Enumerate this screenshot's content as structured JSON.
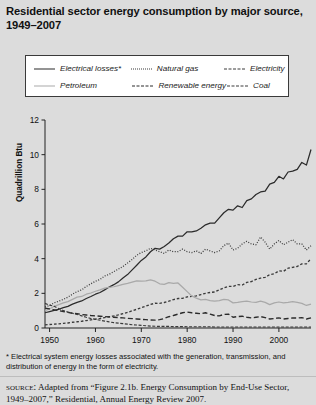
{
  "title": "Residential sector energy consumption by major source, 1949–2007",
  "legend": {
    "rows": [
      [
        {
          "label": "Electrical losses*",
          "style": "solid-dark",
          "color": "#2b2b2b"
        },
        {
          "label": "Natural gas",
          "style": "dot",
          "color": "#3a3a3a"
        },
        {
          "label": "Electricity",
          "style": "dash",
          "color": "#3a3a3a"
        }
      ],
      [
        {
          "label": "Petroleum",
          "style": "solid-light",
          "color": "#a9a9a9"
        },
        {
          "label": "Renewable energy",
          "style": "longdash",
          "color": "#2b2b2b"
        },
        {
          "label": "Coal",
          "style": "coal",
          "color": "#3a3a3a"
        }
      ]
    ]
  },
  "footnote": "* Electrical system energy losses associated with the generation, transmission, and distribution of energy in the form of electricity.",
  "source": {
    "label": "source:",
    "text": "Adapted from “Figure 2.1b. Energy Consumption by End-Use Sector, 1949–2007,” Residential, Annual Energy Review 2007."
  },
  "chart_data": {
    "type": "line",
    "title": "Residential sector energy consumption by major source, 1949–2007",
    "xlabel": "",
    "ylabel": "Quadrillion Btu",
    "xlim": [
      1949,
      2007
    ],
    "ylim": [
      0,
      12
    ],
    "yticks": [
      0,
      2,
      4,
      6,
      8,
      10,
      12
    ],
    "xticks": [
      1950,
      1960,
      1970,
      1980,
      1990,
      2000
    ],
    "grid": false,
    "legend_position": "top",
    "x": [
      1949,
      1950,
      1951,
      1952,
      1953,
      1954,
      1955,
      1956,
      1957,
      1958,
      1959,
      1960,
      1961,
      1962,
      1963,
      1964,
      1965,
      1966,
      1967,
      1968,
      1969,
      1970,
      1971,
      1972,
      1973,
      1974,
      1975,
      1976,
      1977,
      1978,
      1979,
      1980,
      1981,
      1982,
      1983,
      1984,
      1985,
      1986,
      1987,
      1988,
      1989,
      1990,
      1991,
      1992,
      1993,
      1994,
      1995,
      1996,
      1997,
      1998,
      1999,
      2000,
      2001,
      2002,
      2003,
      2004,
      2005,
      2006,
      2007
    ],
    "series": [
      {
        "name": "Electrical losses*",
        "style": "solid",
        "color": "#2b2b2b",
        "values": [
          0.88,
          0.95,
          1.02,
          1.08,
          1.18,
          1.25,
          1.38,
          1.48,
          1.56,
          1.7,
          1.82,
          1.95,
          2.05,
          2.2,
          2.36,
          2.5,
          2.66,
          2.88,
          3.08,
          3.35,
          3.62,
          3.9,
          4.1,
          4.4,
          4.6,
          4.55,
          4.7,
          4.9,
          5.15,
          5.3,
          5.3,
          5.55,
          5.55,
          5.6,
          5.75,
          5.95,
          6.05,
          6.05,
          6.35,
          6.65,
          6.85,
          6.8,
          7.05,
          6.95,
          7.35,
          7.45,
          7.7,
          7.85,
          7.9,
          8.3,
          8.4,
          8.75,
          8.6,
          9.0,
          9.05,
          9.15,
          9.55,
          9.4,
          10.3
        ]
      },
      {
        "name": "Natural gas",
        "style": "dotted",
        "color": "#3a3a3a",
        "values": [
          1.22,
          1.3,
          1.45,
          1.55,
          1.65,
          1.78,
          1.95,
          2.1,
          2.2,
          2.4,
          2.55,
          2.7,
          2.8,
          3.0,
          3.1,
          3.25,
          3.4,
          3.55,
          3.75,
          3.95,
          4.2,
          4.35,
          4.45,
          4.6,
          4.5,
          4.4,
          4.3,
          4.5,
          4.4,
          4.4,
          4.55,
          4.4,
          4.35,
          4.45,
          4.3,
          4.55,
          4.45,
          4.35,
          4.45,
          4.75,
          4.9,
          4.5,
          4.6,
          4.85,
          5.0,
          4.85,
          4.8,
          5.25,
          4.95,
          4.55,
          4.85,
          5.05,
          4.8,
          4.95,
          5.1,
          4.85,
          4.85,
          4.5,
          4.75
        ]
      },
      {
        "name": "Electricity",
        "style": "dashed-fine",
        "color": "#3a3a3a",
        "values": [
          0.18,
          0.2,
          0.22,
          0.24,
          0.27,
          0.29,
          0.33,
          0.36,
          0.39,
          0.43,
          0.47,
          0.51,
          0.55,
          0.6,
          0.65,
          0.7,
          0.76,
          0.83,
          0.9,
          0.99,
          1.08,
          1.17,
          1.26,
          1.36,
          1.43,
          1.42,
          1.47,
          1.55,
          1.64,
          1.7,
          1.71,
          1.8,
          1.82,
          1.85,
          1.93,
          2.0,
          2.05,
          2.08,
          2.2,
          2.32,
          2.4,
          2.4,
          2.5,
          2.48,
          2.63,
          2.68,
          2.8,
          2.88,
          2.92,
          3.08,
          3.13,
          3.3,
          3.27,
          3.45,
          3.5,
          3.55,
          3.7,
          3.7,
          4.0
        ]
      },
      {
        "name": "Petroleum",
        "style": "solid",
        "color": "#a9a9a9",
        "values": [
          1.0,
          1.1,
          1.25,
          1.35,
          1.45,
          1.52,
          1.65,
          1.78,
          1.82,
          1.95,
          2.02,
          2.12,
          2.2,
          2.3,
          2.35,
          2.38,
          2.45,
          2.52,
          2.58,
          2.65,
          2.72,
          2.7,
          2.72,
          2.78,
          2.7,
          2.55,
          2.52,
          2.62,
          2.58,
          2.6,
          2.35,
          2.1,
          1.85,
          1.72,
          1.62,
          1.65,
          1.58,
          1.55,
          1.58,
          1.65,
          1.62,
          1.45,
          1.48,
          1.52,
          1.55,
          1.5,
          1.48,
          1.55,
          1.48,
          1.35,
          1.45,
          1.5,
          1.45,
          1.48,
          1.52,
          1.48,
          1.42,
          1.3,
          1.38
        ]
      },
      {
        "name": "Renewable energy",
        "style": "dashed-long",
        "color": "#2b2b2b",
        "values": [
          1.15,
          1.1,
          1.05,
          1.0,
          0.95,
          0.9,
          0.85,
          0.82,
          0.78,
          0.75,
          0.72,
          0.7,
          0.68,
          0.66,
          0.64,
          0.62,
          0.6,
          0.58,
          0.56,
          0.54,
          0.52,
          0.5,
          0.48,
          0.46,
          0.45,
          0.48,
          0.55,
          0.65,
          0.72,
          0.8,
          0.88,
          0.92,
          0.88,
          0.85,
          0.82,
          0.88,
          0.8,
          0.72,
          0.7,
          0.78,
          0.8,
          0.62,
          0.66,
          0.68,
          0.62,
          0.58,
          0.62,
          0.66,
          0.6,
          0.52,
          0.55,
          0.58,
          0.52,
          0.55,
          0.58,
          0.58,
          0.6,
          0.52,
          0.58
        ]
      },
      {
        "name": "Coal",
        "style": "dashed-dot",
        "color": "#3a3a3a",
        "values": [
          1.42,
          1.32,
          1.25,
          1.12,
          1.0,
          0.92,
          0.85,
          0.78,
          0.7,
          0.62,
          0.55,
          0.5,
          0.45,
          0.4,
          0.35,
          0.31,
          0.28,
          0.25,
          0.22,
          0.19,
          0.17,
          0.15,
          0.13,
          0.11,
          0.1,
          0.09,
          0.09,
          0.09,
          0.08,
          0.08,
          0.08,
          0.07,
          0.07,
          0.07,
          0.07,
          0.07,
          0.07,
          0.06,
          0.06,
          0.06,
          0.06,
          0.06,
          0.06,
          0.06,
          0.06,
          0.06,
          0.06,
          0.06,
          0.06,
          0.06,
          0.06,
          0.06,
          0.06,
          0.06,
          0.06,
          0.06,
          0.06,
          0.06,
          0.06
        ]
      }
    ]
  }
}
